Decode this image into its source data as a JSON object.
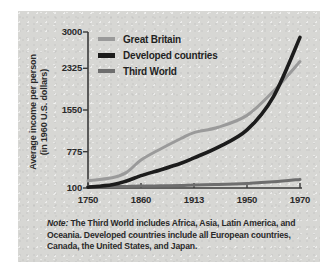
{
  "figure": {
    "background_color": "#ffffff",
    "panel_color": "#d7d7d4"
  },
  "chart_data": {
    "type": "line",
    "title": "",
    "xlabel": "",
    "ylabel": "Average income per person (in 1960 U.S. dollars)",
    "ylabel_line1": "Average income per person",
    "ylabel_line2": "(in 1960 U.S. dollars)",
    "x_ticks": [
      "1750",
      "1860",
      "1913",
      "1950",
      "1970"
    ],
    "x_tick_values": [
      1750,
      1860,
      1913,
      1950,
      1970
    ],
    "y_ticks": [
      "100",
      "775",
      "1550",
      "2325",
      "3000"
    ],
    "y_tick_values": [
      100,
      775,
      1550,
      2325,
      3000
    ],
    "ylim": [
      100,
      3000
    ],
    "grid": false,
    "legend_position": "upper-left-inside",
    "series": [
      {
        "name": "Great Britain",
        "color": "#9a9a9a",
        "width": 3.0,
        "x": [
          1750,
          1800,
          1830,
          1860,
          1880,
          1900,
          1913,
          1930,
          1950,
          1960,
          1970
        ],
        "values": [
          235,
          290,
          390,
          620,
          830,
          1020,
          1130,
          1230,
          1450,
          1900,
          2450
        ]
      },
      {
        "name": "Developed countries",
        "color": "#1c1c1c",
        "width": 3.6,
        "x": [
          1750,
          1800,
          1830,
          1860,
          1880,
          1900,
          1913,
          1930,
          1950,
          1960,
          1970
        ],
        "values": [
          115,
          160,
          230,
          330,
          440,
          560,
          660,
          860,
          1180,
          1800,
          2900
        ]
      },
      {
        "name": "Third World",
        "color": "#6e6e6e",
        "width": 3.0,
        "x": [
          1750,
          1800,
          1830,
          1860,
          1880,
          1900,
          1913,
          1930,
          1950,
          1960,
          1970
        ],
        "values": [
          130,
          130,
          130,
          135,
          140,
          145,
          155,
          165,
          185,
          215,
          260
        ]
      }
    ]
  },
  "legend": {
    "items": [
      {
        "label": "Great Britain",
        "color": "#9a9a9a"
      },
      {
        "label": "Developed countries",
        "color": "#1c1c1c"
      },
      {
        "label": "Third World",
        "color": "#6e6e6e"
      }
    ]
  },
  "note": {
    "word": "Note:",
    "body": "The Third World includes Africa, Asia, Latin America, and Oceania. Developed countries include all European countries, Canada, the United States, and Japan."
  }
}
